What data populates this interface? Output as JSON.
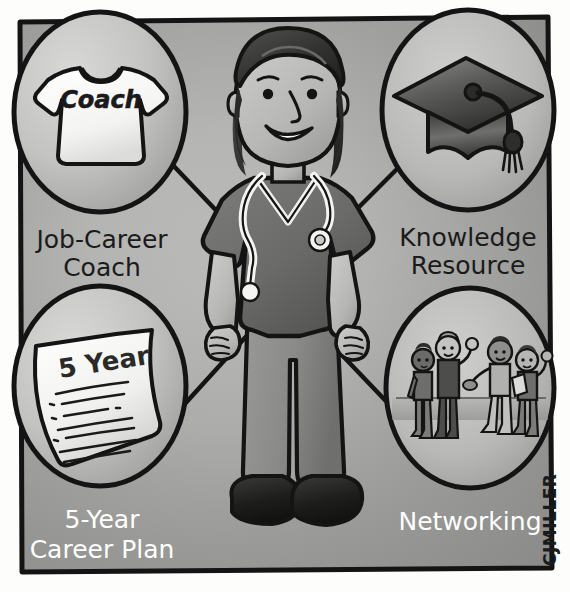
{
  "illustration": {
    "title": "Career Development Resources",
    "subject": "cartoon-nurse-in-scrubs",
    "style": "grayscale-cartoon-line-drawing",
    "frame": {
      "border_color": "#1a1a1a",
      "background_light": "#e9e9e7",
      "background_mid": "#b6b6b4",
      "background_dark": "#8e8e8c"
    },
    "palette": {
      "ink": "#141414",
      "white": "#ffffff",
      "paper": "#f2f2f0",
      "skin": "#b9b9b7",
      "hair": "#3a3a3a",
      "scrubs": "#6e6e6c",
      "pants": "#8a8a88",
      "shoes": "#1e1e1e",
      "label_dark": "#1a1a1a",
      "label_light": "#ffffff"
    }
  },
  "bubbles": [
    {
      "id": "job-career-coach",
      "icon": "tshirt-icon",
      "icon_text": "Coach",
      "label_line1": "Job-Career",
      "label_line2": "Coach",
      "label_color": "#1a1a1a",
      "position": "top-left"
    },
    {
      "id": "knowledge-resource",
      "icon": "graduation-cap-icon",
      "icon_text": "",
      "label_line1": "Knowledge",
      "label_line2": "Resource",
      "label_color": "#1a1a1a",
      "position": "top-right"
    },
    {
      "id": "five-year-career-plan",
      "icon": "document-icon",
      "icon_text": "5 Year",
      "label_line1": "5-Year",
      "label_line2": "Career Plan",
      "label_color": "#ffffff",
      "position": "bottom-left"
    },
    {
      "id": "networking",
      "icon": "people-group-icon",
      "icon_text": "",
      "label_line1": "Networking",
      "label_line2": "",
      "label_color": "#ffffff",
      "position": "bottom-right"
    }
  ],
  "signature": {
    "text": "CJMILLER",
    "orientation": "vertical-rotated"
  }
}
